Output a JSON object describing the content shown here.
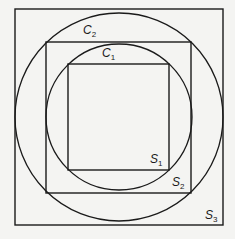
{
  "diagram": {
    "stroke_color": "#1a1a1a",
    "background": "#f4f4f2",
    "labels": {
      "c2": {
        "base": "C",
        "sub": "2"
      },
      "c1": {
        "base": "C",
        "sub": "1"
      },
      "s1": {
        "base": "S",
        "sub": "1"
      },
      "s2": {
        "base": "S",
        "sub": "2"
      },
      "s3": {
        "base": "S",
        "sub": "3"
      }
    }
  }
}
